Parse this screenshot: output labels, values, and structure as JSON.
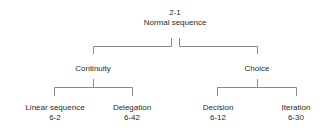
{
  "diagram": {
    "root": {
      "code": "2-1",
      "label": "Normal sequence"
    },
    "branches": [
      {
        "label": "Continuity",
        "children": [
          {
            "label": "Linear sequence",
            "code": "6-2"
          },
          {
            "label": "Delegation",
            "code": "6-42"
          }
        ]
      },
      {
        "label": "Choice",
        "children": [
          {
            "label": "Decision",
            "code": "6-12"
          },
          {
            "label": "Iteration",
            "code": "6-30"
          }
        ]
      }
    ]
  }
}
